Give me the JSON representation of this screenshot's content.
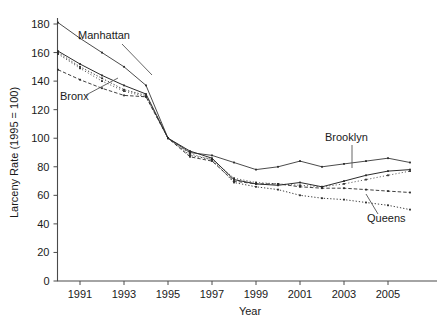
{
  "chart_data": {
    "type": "line",
    "title": "",
    "xlabel": "Year",
    "ylabel": "Larceny Rate (1995 = 100)",
    "xlim": [
      1990,
      2006
    ],
    "ylim": [
      0,
      185
    ],
    "yticks": [
      0,
      20,
      40,
      60,
      80,
      100,
      120,
      140,
      160,
      180
    ],
    "xticks": [
      1991,
      1993,
      1995,
      1997,
      1999,
      2001,
      2003,
      2005
    ],
    "grid": false,
    "legend_position": "inline-annotations",
    "x": [
      1990,
      1991,
      1992,
      1993,
      1994,
      1995,
      1996,
      1997,
      1998,
      1999,
      2000,
      2001,
      2002,
      2003,
      2004,
      2005,
      2006
    ],
    "series": [
      {
        "name": "Manhattan",
        "style": "solid-thin",
        "values": [
          181,
          170,
          160,
          150,
          137,
          100,
          90,
          88,
          83,
          78,
          80,
          84,
          80,
          82,
          84,
          86,
          83
        ]
      },
      {
        "name": "Brooklyn",
        "style": "solid",
        "values": [
          161,
          152,
          144,
          137,
          131,
          100,
          91,
          86,
          71,
          68,
          67,
          69,
          66,
          70,
          74,
          77,
          78
        ]
      },
      {
        "name": "Bronx",
        "style": "dashed",
        "values": [
          148,
          141,
          135,
          130,
          129,
          100,
          87,
          84,
          70,
          68,
          68,
          66,
          65,
          65,
          64,
          63,
          62
        ]
      },
      {
        "name": "Queens",
        "style": "dotted",
        "values": [
          160,
          150,
          142,
          134,
          130,
          100,
          88,
          85,
          69,
          66,
          64,
          60,
          58,
          57,
          55,
          53,
          50
        ]
      },
      {
        "name": "Staten Island",
        "style": "dotted-fine",
        "values": [
          159,
          149,
          140,
          133,
          129,
          100,
          89,
          85,
          72,
          69,
          68,
          67,
          66,
          68,
          71,
          74,
          77
        ]
      }
    ],
    "annotations": [
      {
        "label": "Manhattan",
        "x_px": 78,
        "y_px": 39
      },
      {
        "label": "Bronx",
        "x_px": 60,
        "y_px": 100
      },
      {
        "label": "Brooklyn",
        "x_px": 325,
        "y_px": 141
      },
      {
        "label": "Queens",
        "x_px": 367,
        "y_px": 222
      }
    ]
  },
  "axes": {
    "ylabel": "Larceny Rate (1995 = 100)",
    "xlabel": "Year",
    "ytick_labels": [
      "0",
      "20",
      "40",
      "60",
      "80",
      "100",
      "120",
      "140",
      "160",
      "180"
    ],
    "xtick_labels": [
      "1991",
      "1993",
      "1995",
      "1997",
      "1999",
      "2001",
      "2003",
      "2005"
    ]
  },
  "colors": {
    "axis": "#4a4a4a",
    "text": "#1a1a1a",
    "series": "#2b2b2b",
    "leader": "#555555",
    "background": "#ffffff"
  }
}
